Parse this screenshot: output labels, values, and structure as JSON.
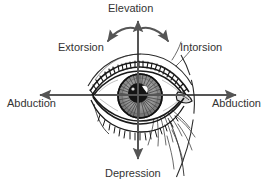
{
  "figure": {
    "background_color": "#ffffff",
    "axis_color": "#555555",
    "label_color": "#333333",
    "ink_color": "#1a1a1a"
  },
  "labels": {
    "elevation": "Elevation",
    "extorsion": "Extorsion",
    "intorsion": "Intorsion",
    "abduction_left": "Abduction",
    "abduction_right": "Abduction",
    "depression": "Depression"
  },
  "axes": [
    {
      "name": "vertical-up-axis",
      "label": "Elevation",
      "direction": "up",
      "arrow_tip": [
        138,
        17
      ]
    },
    {
      "name": "vertical-down-axis",
      "label": "Depression",
      "direction": "down",
      "arrow_tip": [
        138,
        163
      ]
    },
    {
      "name": "horizontal-left-axis",
      "label": "Abduction",
      "direction": "left",
      "arrow_tip": [
        36,
        95
      ]
    },
    {
      "name": "horizontal-right-axis",
      "label": "Abduction",
      "direction": "right",
      "arrow_tip": [
        240,
        95
      ]
    }
  ],
  "rotation_arc": {
    "name": "torsion-arc",
    "left_label": "Extorsion",
    "right_label": "Intorsion",
    "left_arrow_tip": [
      104,
      44
    ],
    "right_arrow_tip": [
      174,
      44
    ],
    "apex": [
      138,
      27
    ]
  },
  "illustration": {
    "name": "eye-illustration",
    "style": "pen-and-ink line drawing",
    "center": [
      138,
      95
    ],
    "parts": [
      "upper-eyelid",
      "lower-eyelid",
      "upper-eyelashes",
      "lower-eyelashes",
      "eyelid-crease",
      "sclera",
      "iris",
      "pupil",
      "corneal-highlight",
      "lacrimal-caruncle",
      "temple-hatching",
      "cheek-contour"
    ]
  }
}
